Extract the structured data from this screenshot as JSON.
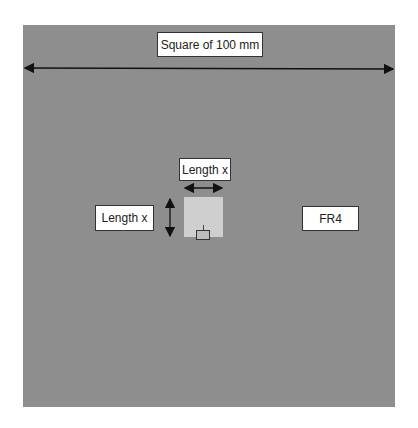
{
  "diagram": {
    "board_label": "FR4",
    "dimension_label": "Square of 100 mm",
    "patch_width_label": "Length x",
    "patch_height_label": "Length x",
    "colors": {
      "board": "#8e8e8e",
      "patch": "#cfcfcf",
      "arrow": "#111111",
      "label_bg": "#ffffff"
    }
  }
}
